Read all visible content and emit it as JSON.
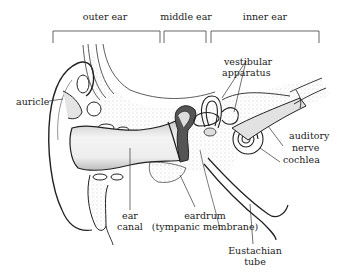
{
  "diagram": {
    "sections": [
      {
        "id": "outer",
        "label": "outer ear",
        "x1": 53,
        "x2": 160
      },
      {
        "id": "middle",
        "label": "middle ear",
        "x1": 164,
        "x2": 206
      },
      {
        "id": "inner",
        "label": "inner ear",
        "x1": 211,
        "x2": 319
      }
    ],
    "labels": {
      "auricle": "auricle",
      "vestibular_1": "vestibular",
      "vestibular_2": "apparatus",
      "auditory_1": "auditory",
      "auditory_2": "nerve",
      "cochlea": "cochlea",
      "ear_1": "ear",
      "ear_2": "canal",
      "eardrum_1": "eardrum",
      "eardrum_2": "(tympanic membrane)",
      "eustachian_1": "Eustachian",
      "eustachian_2": "tube"
    },
    "colors": {
      "line": "#222222",
      "stipple": "#9a9a9a",
      "shade": "#d8d8d8",
      "background": "#ffffff"
    }
  }
}
